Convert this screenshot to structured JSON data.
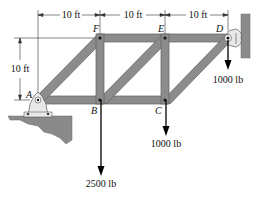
{
  "dimensions": {
    "top_spans": [
      "10 ft",
      "10 ft",
      "10 ft"
    ],
    "height": "10 ft"
  },
  "nodes": {
    "A": "A",
    "B": "B",
    "C": "C",
    "D": "D",
    "E": "E",
    "F": "F"
  },
  "loads": {
    "B": "2500 lb",
    "C": "1000 lb",
    "D": "1000 lb"
  },
  "colors": {
    "member_fill": "#8c8c8c",
    "member_edge": "#5a5a5a",
    "ground": "#7a7a7a",
    "support": "#e6e6e6",
    "arrow": "#000000"
  }
}
